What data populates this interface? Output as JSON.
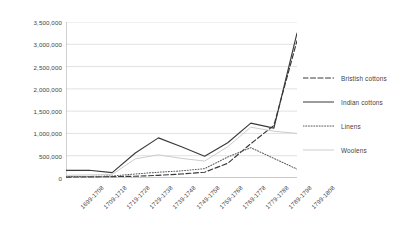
{
  "chart_data": {
    "type": "line",
    "title": "",
    "xlabel": "",
    "ylabel": "",
    "ylim": [
      0,
      3500000
    ],
    "ytick_step": 500000,
    "grid": true,
    "legend_position": "right",
    "ytick_labels": [
      "3,500,000",
      "3,000,000",
      "2,500,000",
      "2,000,000",
      "1,500,000",
      "1,000,000",
      "500,000",
      "0"
    ],
    "categories": [
      "1699-1708",
      "1709-1718",
      "1719-1728",
      "1729-1738",
      "1739-1748",
      "1749-1758",
      "1759-1768",
      "1769-1778",
      "1779-1788",
      "1789-1798",
      "1799-1808"
    ],
    "series": [
      {
        "name": "Bristish cottons",
        "style": "dashed",
        "color": "#3a3a3a",
        "values": [
          20000,
          25000,
          30000,
          40000,
          60000,
          90000,
          130000,
          330000,
          770000,
          1180000,
          3080000
        ]
      },
      {
        "name": "Indian cottons",
        "style": "solid",
        "color": "#3a3a3a",
        "values": [
          170000,
          175000,
          120000,
          560000,
          900000,
          700000,
          490000,
          790000,
          1230000,
          1120000,
          3250000
        ]
      },
      {
        "name": "Linens",
        "style": "dotted",
        "color": "#5a5a5a",
        "values": [
          30000,
          35000,
          45000,
          90000,
          130000,
          160000,
          210000,
          470000,
          680000,
          440000,
          200000
        ]
      },
      {
        "name": "Woolens",
        "style": "solid-light",
        "color": "#c9c9c9",
        "values": [
          60000,
          70000,
          80000,
          430000,
          520000,
          440000,
          380000,
          700000,
          1140000,
          1050000,
          1000000
        ]
      }
    ]
  },
  "legend": {
    "items": [
      {
        "label": "Bristish cottons"
      },
      {
        "label": "Indian cottons"
      },
      {
        "label": "Linens"
      },
      {
        "label": "Woolens"
      }
    ]
  }
}
